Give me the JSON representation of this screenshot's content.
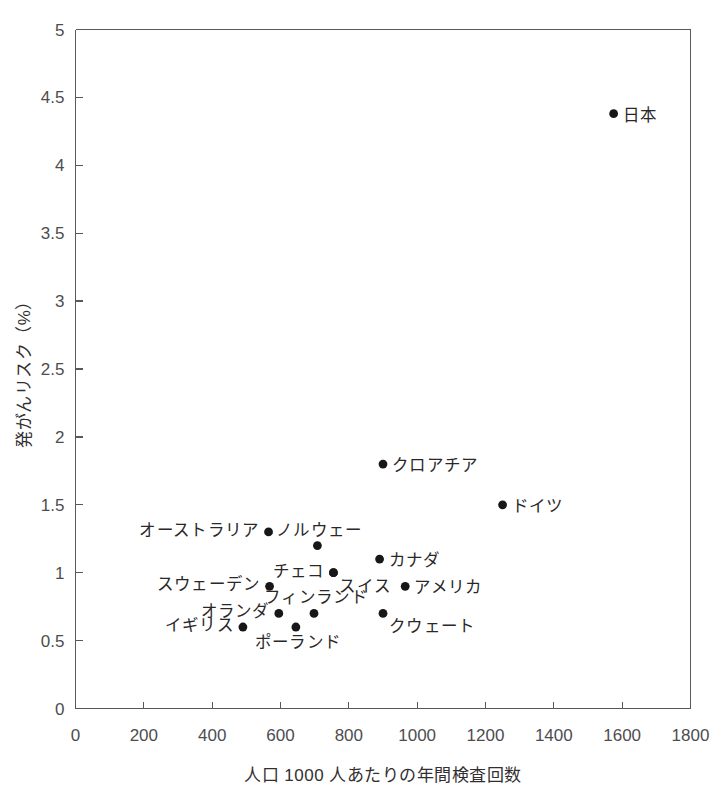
{
  "chart_data": {
    "type": "scatter",
    "title": "",
    "xlabel": "人口 1000 人あたりの年間検査回数",
    "ylabel": "発がんリスク（%）",
    "xlim": [
      0,
      1800
    ],
    "ylim": [
      0,
      5
    ],
    "xticks": [
      "0",
      "200",
      "400",
      "600",
      "800",
      "1000",
      "1200",
      "1400",
      "1600",
      "1800"
    ],
    "xtick_values": [
      0,
      200,
      400,
      600,
      800,
      1000,
      1200,
      1400,
      1600,
      1800
    ],
    "yticks": [
      "0",
      "0.5",
      "1",
      "1.5",
      "2",
      "2.5",
      "3",
      "3.5",
      "4",
      "4.5",
      "5"
    ],
    "ytick_values": [
      0,
      0.5,
      1,
      1.5,
      2,
      2.5,
      3,
      3.5,
      4,
      4.5,
      5
    ],
    "grid": false,
    "legend": "none",
    "marker_color": "#19161a",
    "axis_color": "#58595b",
    "points": [
      {
        "label": "日本",
        "x": 1575,
        "y": 4.38,
        "label_pos": "right"
      },
      {
        "label": "クロアチア",
        "x": 900,
        "y": 1.8,
        "label_pos": "right"
      },
      {
        "label": "ドイツ",
        "x": 1250,
        "y": 1.5,
        "label_pos": "right"
      },
      {
        "label": "オーストラリア",
        "x": 565,
        "y": 1.3,
        "label_pos": "left"
      },
      {
        "label": "ノルウェー",
        "x": 708,
        "y": 1.2,
        "label_pos": "above"
      },
      {
        "label": "カナダ",
        "x": 890,
        "y": 1.1,
        "label_pos": "right"
      },
      {
        "label": "チェコ",
        "x": 755,
        "y": 1.0,
        "label_pos": "left"
      },
      {
        "label": "スイス",
        "x": 755,
        "y": 1.0,
        "label_pos": "below-right"
      },
      {
        "label": "スウェーデン",
        "x": 568,
        "y": 0.9,
        "label_pos": "left"
      },
      {
        "label": "アメリカ",
        "x": 965,
        "y": 0.9,
        "label_pos": "right"
      },
      {
        "label": "フィンランド",
        "x": 698,
        "y": 0.7,
        "label_pos": "above"
      },
      {
        "label": "オランダ",
        "x": 595,
        "y": 0.7,
        "label_pos": "left"
      },
      {
        "label": "クウェート",
        "x": 900,
        "y": 0.7,
        "label_pos": "below-right"
      },
      {
        "label": "ポーランド",
        "x": 645,
        "y": 0.6,
        "label_pos": "below"
      },
      {
        "label": "イギリス",
        "x": 490,
        "y": 0.6,
        "label_pos": "left"
      }
    ]
  }
}
